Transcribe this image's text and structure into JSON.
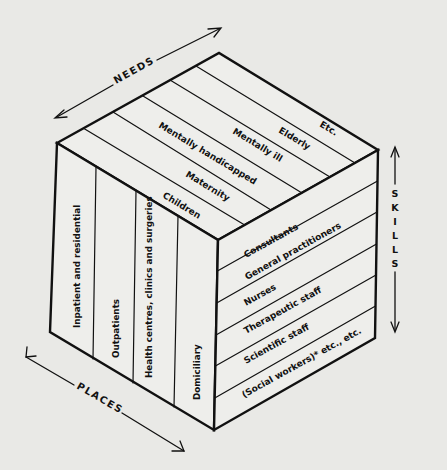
{
  "figure": {
    "axes": {
      "needs": "NEEDS",
      "places": "PLACES",
      "skills": [
        "S",
        "K",
        "I",
        "L",
        "L",
        "S"
      ]
    },
    "needs": [
      "Children",
      "Maternity",
      "Mentally handicapped",
      "Mentally ill",
      "Elderly",
      "Etc."
    ],
    "places": [
      "Inpatient and residential",
      "Outpatients",
      "Health centres, clinics and surgeries",
      "Domiciliary"
    ],
    "skills": [
      "Consultants",
      "General practitioners",
      "Nurses",
      "Therapeutic staff",
      "Scientific staff",
      "(Social workers)* etc., etc."
    ],
    "colors": {
      "ink": "#111111",
      "paper": "#e9e9e6"
    }
  }
}
